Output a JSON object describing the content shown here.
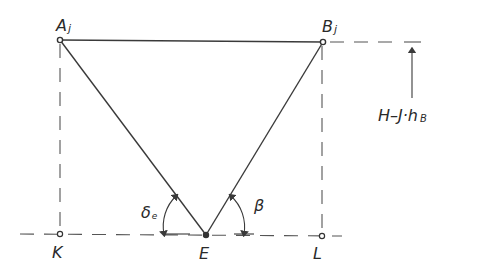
{
  "diagram": {
    "colors": {
      "line": "#3a3a3a",
      "background": "#ffffff"
    },
    "points": {
      "A": {
        "label": "A",
        "sub": "j",
        "x": 60,
        "y": 40
      },
      "B": {
        "label": "B",
        "sub": "j",
        "x": 323,
        "y": 42
      },
      "E": {
        "label": "E",
        "x": 206,
        "y": 235
      },
      "K": {
        "label": "K",
        "x": 60,
        "y": 234
      },
      "L": {
        "label": "L",
        "x": 322,
        "y": 236
      }
    },
    "angles": {
      "delta": {
        "label": "δ",
        "sub": "e"
      },
      "beta": {
        "label": "β"
      }
    },
    "height_label": "H–J·h",
    "height_sub": "B"
  }
}
